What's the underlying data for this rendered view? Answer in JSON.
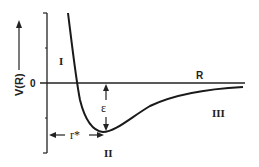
{
  "diagram": {
    "y_axis_label": "V(R)",
    "x_axis_label": "R",
    "zero_label": "0",
    "well_depth_label": "ε",
    "equilibrium_label": "r*",
    "regions": [
      "I",
      "II",
      "III"
    ],
    "colors": {
      "line": "#1a1a1a",
      "background": "#ffffff"
    }
  }
}
